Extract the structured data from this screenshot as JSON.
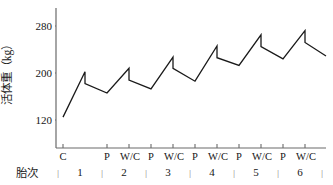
{
  "chart_data": {
    "type": "line",
    "title": "",
    "subtitle": "",
    "xlabel": "胎次",
    "ylabel": "活体重（kg）",
    "ylim": [
      80,
      300
    ],
    "yticks": [
      120,
      200,
      280
    ],
    "ytick_labels": [
      "120",
      "200",
      "280"
    ],
    "grid": false,
    "legend": null,
    "xtick_labels": [
      "C",
      "P",
      "W/C",
      "P",
      "W/C",
      "P",
      "W/C",
      "P",
      "W/C",
      "P",
      "W/C",
      "P",
      "W/C"
    ],
    "parities": [
      "1",
      "2",
      "3",
      "4",
      "5",
      "6"
    ],
    "parity_separator": "|",
    "stage_meanings": {
      "C": "conception",
      "P": "parturition",
      "W/C": "weaning / re-conception"
    },
    "series": [
      {
        "name": "活体重",
        "x": [
          "C",
          "P",
          "P-post",
          "W/C",
          "P",
          "P-post",
          "W/C",
          "P",
          "P-post",
          "W/C",
          "P",
          "P-post",
          "W/C",
          "P",
          "P-post",
          "W/C",
          "P",
          "P-post",
          "W/C"
        ],
        "points": [
          {
            "stage": "C",
            "parity": 1,
            "value": 125
          },
          {
            "stage": "P",
            "parity": 1,
            "value": 202
          },
          {
            "stage": "Ppost",
            "parity": 1,
            "value": 182
          },
          {
            "stage": "W/C",
            "parity": 1,
            "value": 166
          },
          {
            "stage": "P",
            "parity": 2,
            "value": 208
          },
          {
            "stage": "Ppost",
            "parity": 2,
            "value": 188
          },
          {
            "stage": "W/C",
            "parity": 2,
            "value": 173
          },
          {
            "stage": "P",
            "parity": 3,
            "value": 227
          },
          {
            "stage": "Ppost",
            "parity": 3,
            "value": 208
          },
          {
            "stage": "W/C",
            "parity": 3,
            "value": 186
          },
          {
            "stage": "P",
            "parity": 4,
            "value": 246
          },
          {
            "stage": "Ppost",
            "parity": 4,
            "value": 226
          },
          {
            "stage": "W/C",
            "parity": 4,
            "value": 213
          },
          {
            "stage": "P",
            "parity": 5,
            "value": 265
          },
          {
            "stage": "Ppost",
            "parity": 5,
            "value": 245
          },
          {
            "stage": "W/C",
            "parity": 5,
            "value": 224
          },
          {
            "stage": "P",
            "parity": 6,
            "value": 272
          },
          {
            "stage": "Ppost",
            "parity": 6,
            "value": 252
          },
          {
            "stage": "W/C",
            "parity": 6,
            "value": 229
          }
        ]
      }
    ],
    "line_color": "#1a1a1a",
    "axis_color": "#6a6a6a"
  },
  "axes": {
    "y_title": "活体重（kg）",
    "x_title": "胎次",
    "y_tick_labels": [
      "280",
      "200",
      "120"
    ],
    "x_tick_labels": [
      "C",
      "P",
      "W/C",
      "P",
      "W/C",
      "P",
      "W/C",
      "P",
      "W/C",
      "P",
      "W/C",
      "P",
      "W/C"
    ],
    "parity_labels": [
      "1",
      "2",
      "3",
      "4",
      "5",
      "6"
    ],
    "parity_separators": [
      "|",
      "|",
      "|",
      "|",
      "|",
      "|",
      "|"
    ]
  }
}
